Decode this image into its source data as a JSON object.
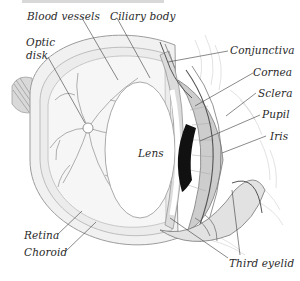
{
  "diagram": {
    "labels": {
      "blood_vessels": "Blood vessels",
      "ciliary_body": "Ciliary body",
      "optic_disk_line1": "Optic",
      "optic_disk_line2": "disk",
      "conjunctiva": "Conjunctiva",
      "cornea": "Cornea",
      "sclera": "Sclera",
      "pupil": "Pupil",
      "iris": "Iris",
      "lens": "Lens",
      "retina": "Retina",
      "choroid": "Choroid",
      "third_eyelid": "Third eyelid"
    },
    "colors": {
      "background": "#ffffff",
      "line": "#3a3a3a",
      "tissue": "#e6e6e6",
      "vessel": "#9a9a9a",
      "pupil": "#111111"
    }
  }
}
